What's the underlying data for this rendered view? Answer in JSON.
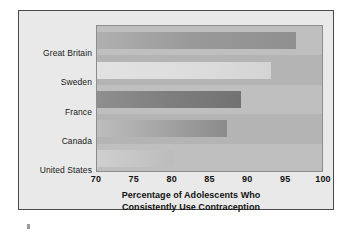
{
  "chart_data": {
    "type": "bar",
    "orientation": "horizontal",
    "title_lines": [
      "Percentage of Adolescents Who",
      "Consistently Use Contraception"
    ],
    "xlabel": "Percentage of Adolescents Who Consistently Use Contraception",
    "ylabel": "",
    "categories": [
      "Great Britain",
      "Sweden",
      "France",
      "Canada",
      "United States"
    ],
    "values": [
      96.3,
      93.0,
      89.0,
      87.2,
      80.0
    ],
    "xlim": [
      70,
      100
    ],
    "xticks": [
      70,
      75,
      80,
      85,
      90,
      95,
      100
    ],
    "xtick_labels": [
      "70",
      "75",
      "80",
      "85",
      "90",
      "95",
      "100"
    ],
    "grid": true,
    "legend": false,
    "series": [
      {
        "name": "Percentage consistently using contraception",
        "values": [
          96.3,
          93.0,
          89.0,
          87.2,
          80.0
        ]
      }
    ],
    "bar_colors": [
      "#9a9a9a",
      "#dcdcdc",
      "#7e7e7e",
      "#a2a2a2",
      "#c4c4c4"
    ],
    "plot_background": "#b9b9b9",
    "figure_background": "#e9e9e9",
    "frame_color": "#4a4a4a"
  }
}
